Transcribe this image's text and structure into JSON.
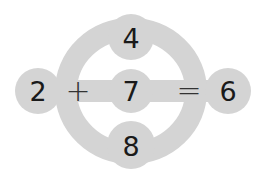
{
  "puzzle": {
    "shape_color": "#d3d3d3",
    "left": "2",
    "plus": "+",
    "center": "7",
    "equals": "=",
    "right": "6",
    "top": "4",
    "bottom": "8"
  }
}
